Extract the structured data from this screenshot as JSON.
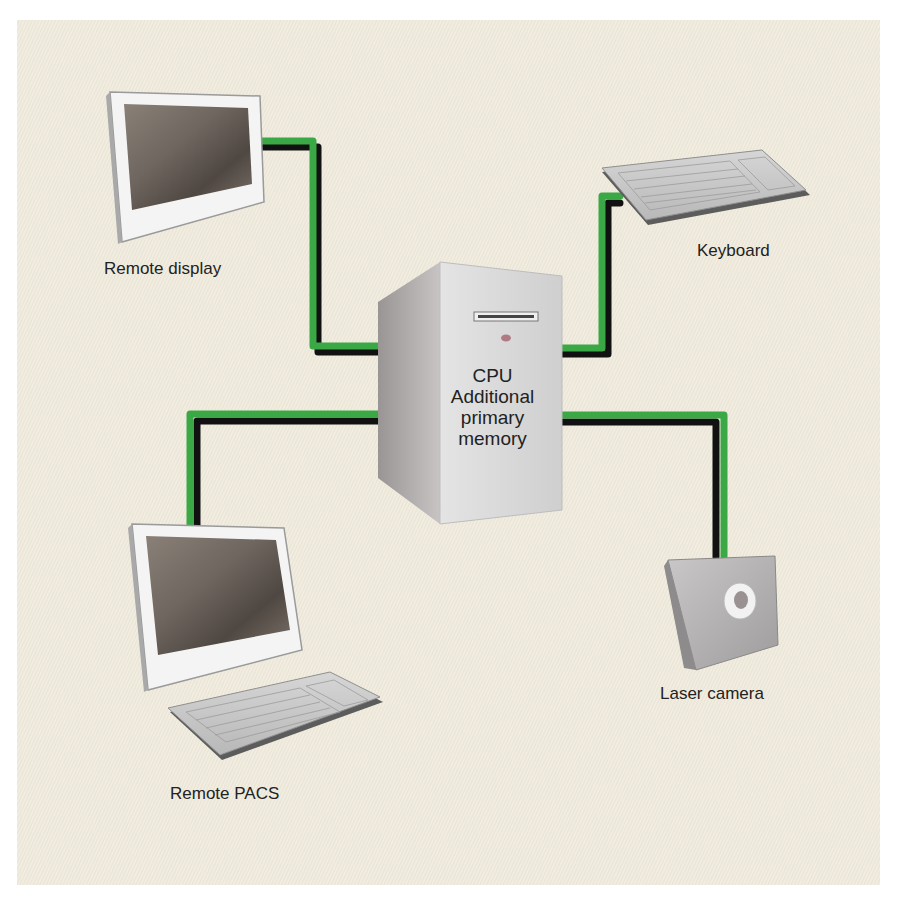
{
  "diagram": {
    "type": "network-topology",
    "background_color": "#efe9db",
    "connector_colors": {
      "green": "#3aa845",
      "black": "#111111"
    },
    "center": {
      "name": "CPU tower",
      "lines": [
        "CPU",
        "Additional",
        "primary",
        "memory"
      ]
    },
    "nodes": [
      {
        "id": "remote-display",
        "label": "Remote display",
        "icon": "monitor-icon"
      },
      {
        "id": "keyboard",
        "label": "Keyboard",
        "icon": "keyboard-icon"
      },
      {
        "id": "remote-pacs",
        "label": "Remote PACS",
        "icon": "workstation-icon"
      },
      {
        "id": "laser-camera",
        "label": "Laser camera",
        "icon": "camera-icon"
      }
    ],
    "edges": [
      {
        "from": "cpu",
        "to": "remote-display"
      },
      {
        "from": "cpu",
        "to": "keyboard"
      },
      {
        "from": "cpu",
        "to": "remote-pacs"
      },
      {
        "from": "cpu",
        "to": "laser-camera"
      }
    ]
  }
}
